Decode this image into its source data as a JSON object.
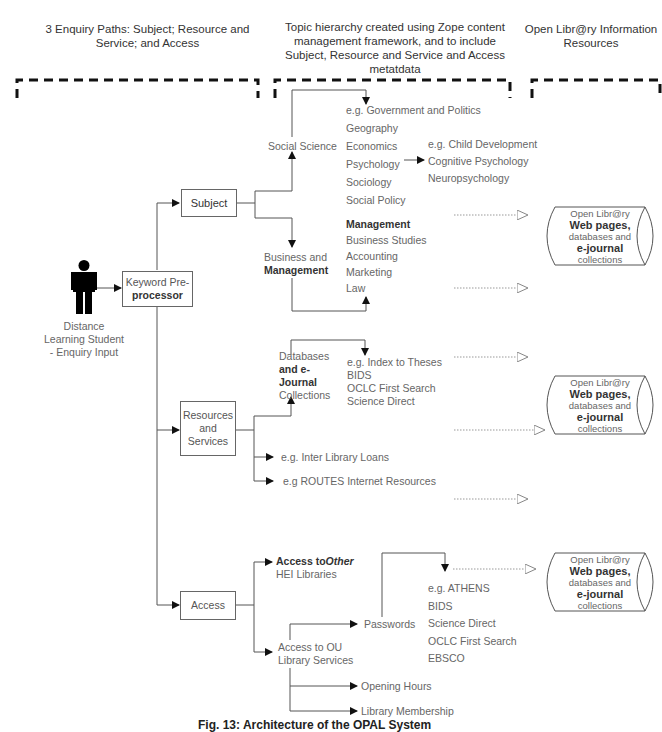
{
  "headers": {
    "left": "3 Enquiry Paths: Subject; Resource and Service; and Access",
    "middle": "Topic hierarchy created using Zope content management framework, and to include Subject, Resource and Service and Access metatdata",
    "right": "Open Libr@ry Information Resources"
  },
  "student": {
    "icon": "person-icon",
    "label_line1": "Distance",
    "label_line2": "Learning Student",
    "label_line3": "- Enquiry Input"
  },
  "keyword_box": {
    "line1": "Keyword Pre-",
    "line2": "processor"
  },
  "paths": {
    "subject": "Subject",
    "resources_line1": "Resources",
    "resources_line2": "and",
    "resources_line3": "Services",
    "access": "Access"
  },
  "social_science": {
    "label": "Social Science",
    "items": [
      "e.g. Government and Politics",
      "Geography",
      "Economics",
      "Psychology",
      "Sociology",
      "Social Policy"
    ],
    "psychology_sub": [
      "e.g. Child Development",
      "Cognitive Psychology",
      "Neuropsychology"
    ]
  },
  "business": {
    "label_line1": "Business and",
    "label_line2": "Management",
    "items": [
      "Management",
      "Business Studies",
      "Accounting",
      "Marketing",
      "Law"
    ]
  },
  "databases": {
    "label_line1": "Databases",
    "label_line2": "and e-",
    "label_line3": "Journal",
    "label_line4": "Collections",
    "items": [
      "e.g. Index to Theses",
      "BIDS",
      "OCLC First Search",
      "Science Direct"
    ]
  },
  "services": {
    "inter_library": "e.g. Inter Library Loans",
    "routes": "e.g ROUTES Internet Resources"
  },
  "access": {
    "other_bold": "Access to",
    "other_italic": "Other",
    "other_line2": "HEI Libraries",
    "ou_line1": "Access to OU",
    "ou_line2": "Library Services",
    "passwords": "Passwords",
    "password_items": [
      "e.g. ATHENS",
      "BIDS",
      "Science Direct",
      "OCLC First Search",
      "EBSCO"
    ],
    "opening_hours": "Opening Hours",
    "membership": "Library Membership"
  },
  "resources_cylinder": {
    "line1": "Open Libr@ry",
    "line2": "Web pages,",
    "line3": "databases and",
    "line4": "e-journal",
    "line5": "collections"
  },
  "caption": "Fig. 13: Architecture of the OPAL System"
}
